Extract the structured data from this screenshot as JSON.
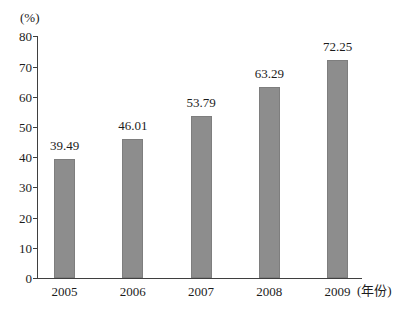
{
  "chart": {
    "ylabel": "(%)",
    "xlabel": "(年份)",
    "bar_color": "#8d8d8d",
    "axis_color": "#3f3f3f",
    "text_color": "#1c1c1c"
  },
  "chart_data": {
    "type": "bar",
    "categories": [
      "2005",
      "2006",
      "2007",
      "2008",
      "2009"
    ],
    "values": [
      39.49,
      46.01,
      53.79,
      63.29,
      72.25
    ],
    "value_labels": [
      "39.49",
      "46.01",
      "53.79",
      "63.29",
      "72.25"
    ],
    "title": "",
    "xlabel": "(年份)",
    "ylabel": "(%)",
    "ylim": [
      0,
      80
    ],
    "yticks": [
      0,
      10,
      20,
      30,
      40,
      50,
      60,
      70,
      80
    ],
    "grid": false,
    "legend": null,
    "bar_color": "#8d8d8d"
  }
}
